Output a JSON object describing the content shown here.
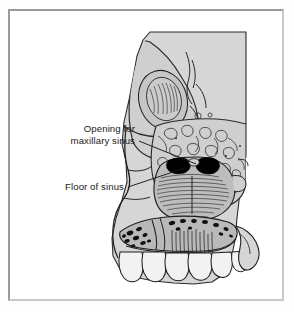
{
  "figure": {
    "kind": "anatomical-illustration",
    "view": "cut-away lateral section of face, nasal cavity, maxillary sinus and upper teeth",
    "frame_color": "#9a9a9a",
    "background_color": "#ffffff",
    "page_color": "#fdfdfd",
    "ink_color": "#1a1a1a",
    "bone_fill_color": "#cfcfcf",
    "cut_surface_fill_color": "#d6d6d6",
    "cancellous_fill_color": "#b5b5b5",
    "cavity_fill_color": "#000000",
    "tooth_fill_color": "#f2f2f2"
  },
  "labels": [
    {
      "id": "opening-for-maxillary-sinus",
      "line1": "Opening for",
      "line2": "maxillary sinus",
      "text_anchor_x": 135,
      "text_line1_y": 132,
      "text_line2_y": 144,
      "leader_from_x": 139,
      "leader_from_y": 141,
      "leader_to_x": 196,
      "leader_to_y": 164,
      "target": "ostium of the maxillary sinus"
    },
    {
      "id": "floor-of-sinus",
      "line1": "Floor of sinus",
      "line2": "",
      "text_anchor_x": 124,
      "text_line1_y": 190,
      "leader_from_x": 128,
      "leader_from_y": 187,
      "leader_to_x": 185,
      "leader_to_y": 168,
      "target": "inferior wall of the maxillary sinus"
    }
  ],
  "structures": [
    {
      "id": "orbit-and-temporal-region",
      "description": "upper cut-away block with orbital contour and temporal bone"
    },
    {
      "id": "nasal-profile",
      "description": "outline of the nose and facial profile"
    },
    {
      "id": "ethmoid-air-cells",
      "description": "stippled cancellous bone superior to the sinus"
    },
    {
      "id": "maxillary-sinus-cavity",
      "description": "black cavity pair at the sinus ostium"
    },
    {
      "id": "turbinate-hatching",
      "description": "densely hatched conchae below the sinus opening"
    },
    {
      "id": "alveolar-bone",
      "description": "trabecular bone band with dark marrow spaces above the teeth"
    },
    {
      "id": "maxillary-teeth",
      "description": "row of upper teeth along the alveolar ridge"
    },
    {
      "id": "maxillary-tuberosity",
      "description": "posterior bone projection at the lower right"
    }
  ]
}
